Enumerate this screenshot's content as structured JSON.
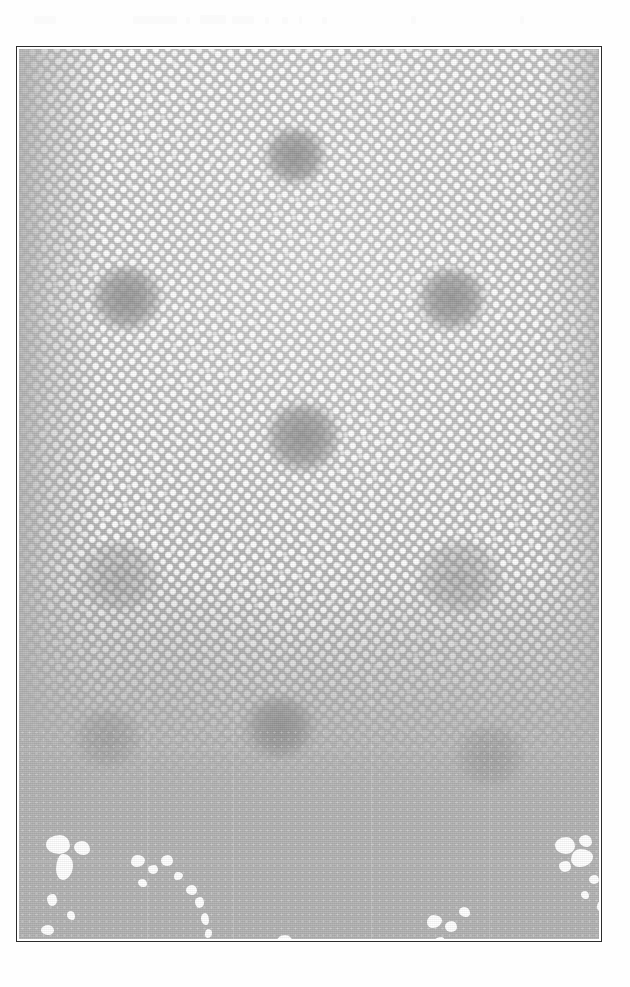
{
  "artwork": {
    "title": "Halftone Screen Plate",
    "medium": "printed halftone reproduction (scanned)",
    "orientation": "portrait",
    "canvas": {
      "width": 630,
      "height": 987,
      "background": "#ffffff"
    },
    "frame": {
      "x": 16,
      "y": 46,
      "width": 586,
      "height": 896,
      "border_color": "#2b2b2b",
      "border_width": 1,
      "inner_background": "#b2b2b2"
    },
    "palette": {
      "paper_white": "#ffffff",
      "ink_gray": "#b2b2b2",
      "ink_gray_dark": "#9a9a9a",
      "ink_gray_light": "#c6c6c6",
      "frame_line": "#2b2b2b",
      "dot_white": "#ffffff"
    },
    "halftone": {
      "dot_color": "#ffffff",
      "ground_color": "#b2b2b2",
      "pitch_px": 9.3,
      "screen_angle_deg": -7,
      "secondary_angle_deg": 11,
      "dot_radius_px": 2.0,
      "description": "Dense grid of white halftone dots on flat gray ground, fading out toward the left edge and across the lower band."
    },
    "regions": [
      {
        "name": "upper-dense-screen",
        "y_range": [
          48,
          620
        ],
        "density": "high"
      },
      {
        "name": "mid-fade",
        "y_range": [
          620,
          790
        ],
        "density": "medium"
      },
      {
        "name": "lower-flat-band",
        "y_range": [
          790,
          940
        ],
        "density": "low"
      }
    ]
  },
  "scan_artifacts": [
    {
      "x": 34,
      "y": 16,
      "w": 22,
      "h": 8
    },
    {
      "x": 133,
      "y": 16,
      "w": 44,
      "h": 8
    },
    {
      "x": 186,
      "y": 17,
      "w": 4,
      "h": 7
    },
    {
      "x": 200,
      "y": 15,
      "w": 26,
      "h": 9
    },
    {
      "x": 232,
      "y": 16,
      "w": 22,
      "h": 8
    },
    {
      "x": 265,
      "y": 17,
      "w": 4,
      "h": 7
    },
    {
      "x": 282,
      "y": 17,
      "w": 6,
      "h": 7
    },
    {
      "x": 299,
      "y": 16,
      "w": 3,
      "h": 8
    },
    {
      "x": 322,
      "y": 17,
      "w": 5,
      "h": 7
    },
    {
      "x": 411,
      "y": 16,
      "w": 5,
      "h": 8
    },
    {
      "x": 520,
      "y": 16,
      "w": 4,
      "h": 8
    }
  ],
  "motifs": [
    {
      "id": "motif-top-center",
      "x": 244,
      "y": 78,
      "w": 64,
      "h": 58,
      "kind": "cross"
    },
    {
      "id": "motif-upper-left",
      "x": 72,
      "y": 216,
      "w": 72,
      "h": 66,
      "kind": "cross"
    },
    {
      "id": "motif-upper-right",
      "x": 398,
      "y": 218,
      "w": 70,
      "h": 64,
      "kind": "cross"
    },
    {
      "id": "motif-center",
      "x": 246,
      "y": 352,
      "w": 76,
      "h": 72,
      "kind": "cross"
    },
    {
      "id": "motif-mid-left",
      "x": 60,
      "y": 492,
      "w": 82,
      "h": 70,
      "kind": "petal"
    },
    {
      "id": "motif-mid-right",
      "x": 398,
      "y": 492,
      "w": 86,
      "h": 72,
      "kind": "petal"
    },
    {
      "id": "motif-low-center",
      "x": 224,
      "y": 646,
      "w": 74,
      "h": 64,
      "kind": "cross"
    },
    {
      "id": "motif-low-left",
      "x": 56,
      "y": 660,
      "w": 66,
      "h": 58,
      "kind": "petal"
    },
    {
      "id": "motif-low-right",
      "x": 436,
      "y": 676,
      "w": 70,
      "h": 60,
      "kind": "petal"
    }
  ],
  "blobs": [
    {
      "x": 27,
      "y": 786,
      "w": 24,
      "h": 19,
      "shape": "b1"
    },
    {
      "x": 37,
      "y": 805,
      "w": 17,
      "h": 26,
      "shape": "b2"
    },
    {
      "x": 55,
      "y": 792,
      "w": 16,
      "h": 14,
      "shape": "b3"
    },
    {
      "x": 28,
      "y": 845,
      "w": 10,
      "h": 12,
      "shape": "b4"
    },
    {
      "x": 22,
      "y": 876,
      "w": 13,
      "h": 10,
      "shape": "b1"
    },
    {
      "x": 48,
      "y": 862,
      "w": 8,
      "h": 9,
      "shape": "b3"
    },
    {
      "x": 112,
      "y": 806,
      "w": 14,
      "h": 12,
      "shape": "b2"
    },
    {
      "x": 129,
      "y": 816,
      "w": 10,
      "h": 9,
      "shape": "b4"
    },
    {
      "x": 142,
      "y": 806,
      "w": 12,
      "h": 11,
      "shape": "b1"
    },
    {
      "x": 119,
      "y": 830,
      "w": 9,
      "h": 8,
      "shape": "b3"
    },
    {
      "x": 155,
      "y": 823,
      "w": 9,
      "h": 8,
      "shape": "b2"
    },
    {
      "x": 167,
      "y": 836,
      "w": 11,
      "h": 10,
      "shape": "b1"
    },
    {
      "x": 176,
      "y": 848,
      "w": 9,
      "h": 11,
      "shape": "b4"
    },
    {
      "x": 182,
      "y": 864,
      "w": 8,
      "h": 12,
      "shape": "b3"
    },
    {
      "x": 186,
      "y": 880,
      "w": 7,
      "h": 9,
      "shape": "b2"
    },
    {
      "x": 238,
      "y": 900,
      "w": 23,
      "h": 19,
      "shape": "b1"
    },
    {
      "x": 258,
      "y": 886,
      "w": 16,
      "h": 14,
      "shape": "b3"
    },
    {
      "x": 276,
      "y": 901,
      "w": 21,
      "h": 17,
      "shape": "b2"
    },
    {
      "x": 300,
      "y": 906,
      "w": 14,
      "h": 13,
      "shape": "b4"
    },
    {
      "x": 314,
      "y": 896,
      "w": 22,
      "h": 20,
      "shape": "b1"
    },
    {
      "x": 336,
      "y": 904,
      "w": 17,
      "h": 15,
      "shape": "b3"
    },
    {
      "x": 212,
      "y": 912,
      "w": 12,
      "h": 10,
      "shape": "b4"
    },
    {
      "x": 408,
      "y": 866,
      "w": 15,
      "h": 13,
      "shape": "b2"
    },
    {
      "x": 426,
      "y": 872,
      "w": 12,
      "h": 11,
      "shape": "b1"
    },
    {
      "x": 440,
      "y": 858,
      "w": 11,
      "h": 10,
      "shape": "b3"
    },
    {
      "x": 416,
      "y": 888,
      "w": 10,
      "h": 9,
      "shape": "b4"
    },
    {
      "x": 536,
      "y": 788,
      "w": 20,
      "h": 17,
      "shape": "b1"
    },
    {
      "x": 552,
      "y": 800,
      "w": 22,
      "h": 18,
      "shape": "b2"
    },
    {
      "x": 560,
      "y": 786,
      "w": 13,
      "h": 12,
      "shape": "b3"
    },
    {
      "x": 540,
      "y": 812,
      "w": 12,
      "h": 11,
      "shape": "b4"
    },
    {
      "x": 570,
      "y": 826,
      "w": 10,
      "h": 9,
      "shape": "b1"
    },
    {
      "x": 562,
      "y": 842,
      "w": 8,
      "h": 8,
      "shape": "b3"
    },
    {
      "x": 578,
      "y": 852,
      "w": 9,
      "h": 10,
      "shape": "b2"
    },
    {
      "x": 586,
      "y": 806,
      "w": 12,
      "h": 14,
      "shape": "b4"
    }
  ],
  "seams": {
    "vertical_x": [
      128,
      214,
      352,
      470
    ],
    "horizontal_y": [
      268,
      520,
      700,
      812
    ]
  }
}
